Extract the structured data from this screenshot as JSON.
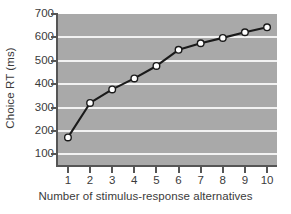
{
  "chart_data": {
    "type": "line",
    "title": "",
    "xlabel": "Number of stimulus-response alternatives",
    "ylabel": "Choice RT (ms)",
    "x": [
      1,
      2,
      3,
      4,
      5,
      6,
      7,
      8,
      9,
      10
    ],
    "values": [
      173,
      320,
      378,
      425,
      478,
      547,
      575,
      598,
      622,
      643
    ],
    "categories": [
      "1",
      "2",
      "3",
      "4",
      "5",
      "6",
      "7",
      "8",
      "9",
      "10"
    ],
    "xlim": [
      0.55,
      10.45
    ],
    "ylim": [
      55,
      700
    ],
    "xticks": [
      "1",
      "2",
      "3",
      "4",
      "5",
      "6",
      "7",
      "8",
      "9",
      "10"
    ],
    "yticks": [
      "700",
      "600",
      "500",
      "400",
      "300",
      "200",
      "100"
    ],
    "ytick_values": [
      700,
      600,
      500,
      400,
      300,
      200,
      100
    ],
    "grid": "horizontal",
    "legend": "none",
    "series": [
      {
        "name": "Choice RT",
        "values": [
          173,
          320,
          378,
          425,
          478,
          547,
          575,
          598,
          622,
          643
        ],
        "line_color": "#1a1a1a",
        "marker": "circle",
        "marker_face_color": "#ffffff",
        "marker_edge_color": "#1a1a1a"
      }
    ],
    "colors": {
      "plot_background": "#a9a9a9",
      "gridline": "#f2f2f2",
      "axis": "#555555",
      "text": "#3b3b3b",
      "figure_background": "#ffffff"
    }
  }
}
